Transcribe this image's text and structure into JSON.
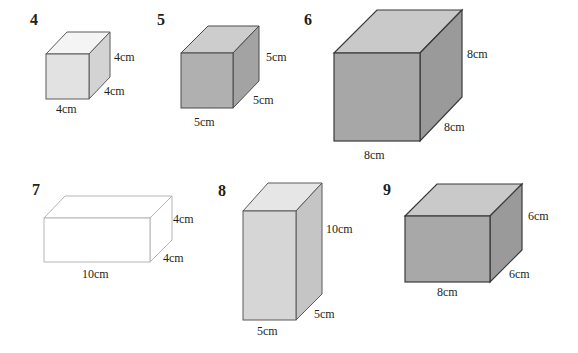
{
  "figure": {
    "colors": {
      "front_dark": "#a9a9a9",
      "side_dark": "#9b9b9b",
      "top_dark": "#cfcfcf",
      "front_light": "#dcdcdc",
      "side_light": "#cccccc",
      "top_light": "#f4f4f4",
      "outline": "#3a3a3a",
      "outline_light": "#b0b0b0",
      "text": "#231f20"
    },
    "shapes": [
      {
        "number": "4",
        "length": "4cm",
        "width": "4cm",
        "height": "4cm",
        "shading": "light"
      },
      {
        "number": "5",
        "length": "5cm",
        "width": "5cm",
        "height": "5cm",
        "shading": "medium"
      },
      {
        "number": "6",
        "length": "8cm",
        "width": "8cm",
        "height": "8cm",
        "shading": "medium"
      },
      {
        "number": "7",
        "length": "10cm",
        "width": "4cm",
        "height": "4cm",
        "shading": "none"
      },
      {
        "number": "8",
        "length": "5cm",
        "width": "5cm",
        "height": "10cm",
        "shading": "light"
      },
      {
        "number": "9",
        "length": "8cm",
        "width": "6cm",
        "height": "6cm",
        "shading": "medium"
      }
    ]
  }
}
